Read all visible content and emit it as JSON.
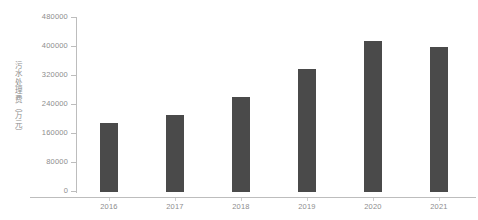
{
  "chart_data": {
    "type": "bar",
    "title": "",
    "subtitle": "",
    "xlabel": "",
    "ylabel": "污水处理费（万元）",
    "categories": [
      "2016",
      "2017",
      "2018",
      "2019",
      "2020",
      "2021"
    ],
    "values": [
      190000,
      212000,
      262000,
      339000,
      416000,
      400000
    ],
    "series": [
      {
        "name": "污水处理费（万元）",
        "values": [
          190000,
          212000,
          262000,
          339000,
          416000,
          400000
        ]
      }
    ],
    "ylim": [
      0,
      480000
    ],
    "yticks": [
      0,
      80000,
      160000,
      240000,
      320000,
      400000,
      480000
    ],
    "ytick_labels": [
      "0",
      "80000",
      "160000",
      "240000",
      "320000",
      "400000",
      "480000"
    ],
    "grid": false,
    "legend": false,
    "legend_position": "none",
    "bar_color": "#4a4a4a",
    "axis_color": "#bdbdbd",
    "text_color": "#8d8d8d",
    "background": "#ffffff"
  }
}
